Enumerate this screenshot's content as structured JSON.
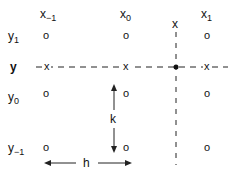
{
  "diagram": {
    "columns": [
      {
        "base": "x",
        "sub": "−1",
        "x": 46
      },
      {
        "base": "x",
        "sub": "0",
        "x": 126
      },
      {
        "base": "x",
        "sub": "1",
        "x": 207
      }
    ],
    "rows": [
      {
        "base": "y",
        "sub": "1",
        "y": 37
      },
      {
        "base": "y",
        "sub": "",
        "y": 67
      },
      {
        "base": "y",
        "sub": "0",
        "y": 98
      },
      {
        "base": "y",
        "sub": "−1",
        "y": 149
      }
    ],
    "target_label": "x",
    "k_label": "k",
    "h_label": "h",
    "grid_marker": "o",
    "interp_marker": "x"
  }
}
